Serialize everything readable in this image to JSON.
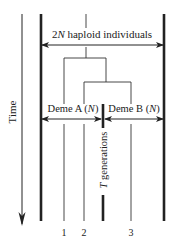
{
  "diagram": {
    "axis_label": "Time",
    "population_label_prefix": "2",
    "population_label_var": "N",
    "population_label_suffix": " haploid individuals",
    "deme_a_label": "Deme A (",
    "deme_a_var": "N",
    "deme_b_label": "Deme B (",
    "deme_b_var": "N",
    "deme_close": ")",
    "split_var": "T",
    "split_label": " generations",
    "lineages": [
      "1",
      "2",
      "3"
    ],
    "colors": {
      "ink": "#222222",
      "background": "#ffffff"
    }
  }
}
